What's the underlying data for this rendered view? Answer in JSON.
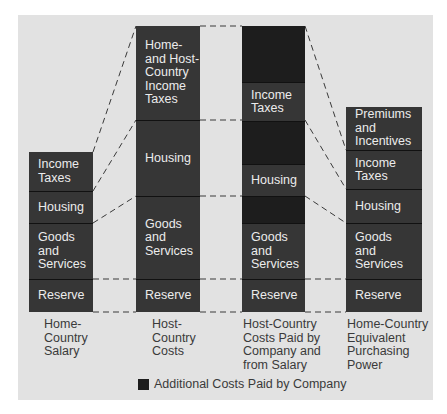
{
  "colors": {
    "background": "#e2e2e2",
    "segment": "#363636",
    "company_paid": "#1d1d1d",
    "text_on_bar": "#ececec",
    "label_text": "#3a3a3a"
  },
  "columns": [
    {
      "label": "Home-\nCountry\nSalary",
      "label_lines": [
        "Home-",
        "Country",
        "Salary"
      ],
      "segments": [
        {
          "text": [
            "Income",
            "Taxes"
          ],
          "type": "normal",
          "top": 152,
          "bottom": 191
        },
        {
          "text": [
            "Housing"
          ],
          "type": "normal",
          "top": 191,
          "bottom": 223
        },
        {
          "text": [
            "Goods",
            "and",
            "Services"
          ],
          "type": "normal",
          "top": 223,
          "bottom": 279
        },
        {
          "text": [
            "Reserve"
          ],
          "type": "normal",
          "top": 279,
          "bottom": 312
        }
      ]
    },
    {
      "label_lines": [
        "Host-",
        "Country",
        "Costs"
      ],
      "segments": [
        {
          "text": [
            "Home-",
            "and Host-",
            "Country",
            "Income",
            "Taxes"
          ],
          "type": "normal",
          "top": 26,
          "bottom": 120
        },
        {
          "text": [
            "Housing"
          ],
          "type": "normal",
          "top": 120,
          "bottom": 196
        },
        {
          "text": [
            "Goods",
            "and",
            "Services"
          ],
          "type": "normal",
          "top": 196,
          "bottom": 279
        },
        {
          "text": [
            "Reserve"
          ],
          "type": "normal",
          "top": 279,
          "bottom": 312
        }
      ]
    },
    {
      "label_lines": [
        "Host-Country",
        "Costs Paid by",
        "Company and",
        "from Salary"
      ],
      "segments": [
        {
          "text": [],
          "type": "company",
          "top": 26,
          "bottom": 82
        },
        {
          "text": [
            "Income",
            "Taxes"
          ],
          "type": "normal",
          "top": 82,
          "bottom": 121
        },
        {
          "text": [],
          "type": "company",
          "top": 121,
          "bottom": 164
        },
        {
          "text": [
            "Housing"
          ],
          "type": "normal",
          "top": 164,
          "bottom": 196
        },
        {
          "text": [],
          "type": "company",
          "top": 196,
          "bottom": 223
        },
        {
          "text": [
            "Goods",
            "and",
            "Services"
          ],
          "type": "normal",
          "top": 223,
          "bottom": 279
        },
        {
          "text": [
            "Reserve"
          ],
          "type": "normal",
          "top": 279,
          "bottom": 312
        }
      ]
    },
    {
      "label_lines": [
        "Home-Country",
        "Equivalent",
        "Purchasing",
        "Power"
      ],
      "segments": [
        {
          "text": [
            "Premiums",
            "and",
            "Incentives"
          ],
          "type": "normal",
          "top": 107,
          "bottom": 150
        },
        {
          "text": [
            "Income",
            "Taxes"
          ],
          "type": "normal",
          "top": 150,
          "bottom": 189
        },
        {
          "text": [
            "Housing"
          ],
          "type": "normal",
          "top": 189,
          "bottom": 223
        },
        {
          "text": [
            "Goods",
            "and",
            "Services"
          ],
          "type": "normal",
          "top": 223,
          "bottom": 279
        },
        {
          "text": [
            "Reserve"
          ],
          "type": "normal",
          "top": 279,
          "bottom": 312
        }
      ]
    }
  ],
  "legend": {
    "swatch": "company-paid",
    "label": "Additional Costs Paid by Company"
  }
}
